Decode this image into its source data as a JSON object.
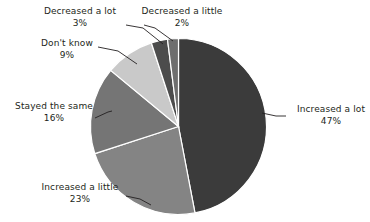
{
  "chart_data": {
    "type": "pie",
    "title": "",
    "subtitle": "",
    "xlabel": "",
    "ylabel": "",
    "legend_position": "none",
    "labels_position": "outside-with-leader-lines",
    "grid": false,
    "start_angle_deg": 0,
    "direction": "clockwise",
    "categories": [
      "Increased a lot",
      "Increased a little",
      "Stayed the same",
      "Don't know",
      "Decreased a lot",
      "Decreased a little"
    ],
    "values": [
      47,
      23,
      16,
      9,
      3,
      2
    ],
    "value_labels": [
      "47%",
      "23%",
      "16%",
      "9%",
      "3%",
      "2%"
    ],
    "units": "percent",
    "total": 100,
    "colors": [
      "#3b3b3b",
      "#848484",
      "#757575",
      "#c9c9c9",
      "#4c4c4c",
      "#6e6e6e"
    ],
    "slices": [
      {
        "label": "Increased a lot",
        "value": 47,
        "value_label": "47%",
        "color": "#3b3b3b"
      },
      {
        "label": "Increased a little",
        "value": 23,
        "value_label": "23%",
        "color": "#848484"
      },
      {
        "label": "Stayed the same",
        "value": 16,
        "value_label": "16%",
        "color": "#757575"
      },
      {
        "label": "Don't know",
        "value": 9,
        "value_label": "9%",
        "color": "#c9c9c9"
      },
      {
        "label": "Decreased a lot",
        "value": 3,
        "value_label": "3%",
        "color": "#4c4c4c"
      },
      {
        "label": "Decreased a little",
        "value": 2,
        "value_label": "2%",
        "color": "#6e6e6e"
      }
    ]
  },
  "labels": {
    "increased_a_lot": {
      "name": "Increased a lot",
      "pct": "47%"
    },
    "increased_a_little": {
      "name": "Increased a little",
      "pct": "23%"
    },
    "stayed_the_same": {
      "name": "Stayed the same",
      "pct": "16%"
    },
    "dont_know": {
      "name": "Don't know",
      "pct": "9%"
    },
    "decreased_a_lot": {
      "name": "Decreased a lot",
      "pct": "3%"
    },
    "decreased_a_little": {
      "name": "Decreased a little",
      "pct": "2%"
    }
  },
  "style": {
    "background": "#ffffff",
    "text_color": "#231f20",
    "leader_line_color": "#231f20",
    "slice_separator_color": "#ffffff"
  }
}
